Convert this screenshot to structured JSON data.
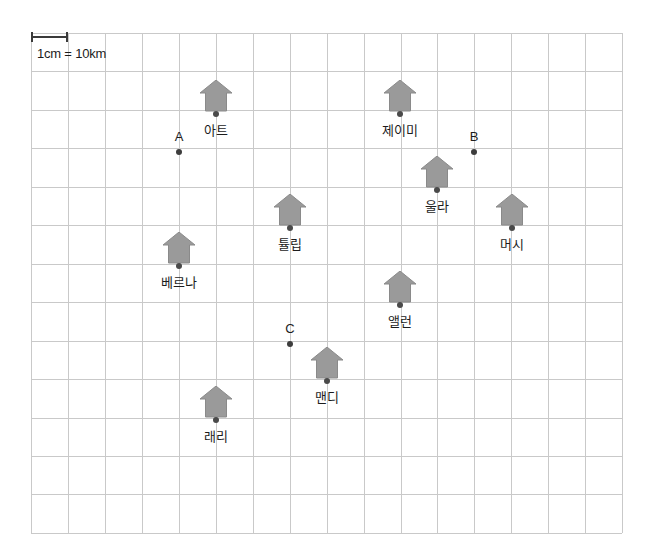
{
  "diagram": {
    "type": "map-with-scale-grid",
    "scale": {
      "label": "1cm = 10km",
      "bar_length_px": 37,
      "bar_x": 31,
      "bar_y": 32,
      "label_x": 37,
      "label_y": 46
    },
    "grid": {
      "x": 31,
      "y": 33,
      "columns": 16,
      "rows": 13,
      "cell_width": 36.95,
      "cell_height": 38.45,
      "line_color": "#c9c9c9"
    },
    "house_color": "#9a9a9a",
    "house_outline": "#8a8a8a",
    "dot_color": "#4a4a4a",
    "places": [
      {
        "name": "아트",
        "icon": "house-icon",
        "x": 216,
        "y": 114,
        "label_dy": 20
      },
      {
        "name": "제이미",
        "icon": "house-icon",
        "x": 400,
        "y": 114,
        "label_dy": 20
      },
      {
        "name": "울라",
        "icon": "house-icon",
        "x": 437,
        "y": 190,
        "label_dy": 20
      },
      {
        "name": "머시",
        "icon": "house-icon",
        "x": 512,
        "y": 228,
        "label_dy": 20
      },
      {
        "name": "튤립",
        "icon": "house-icon",
        "x": 290,
        "y": 228,
        "label_dy": 20
      },
      {
        "name": "베르나",
        "icon": "house-icon",
        "x": 179,
        "y": 266,
        "label_dy": 20
      },
      {
        "name": "앨런",
        "icon": "house-icon",
        "x": 400,
        "y": 305,
        "label_dy": 20
      },
      {
        "name": "맨디",
        "icon": "house-icon",
        "x": 327,
        "y": 381,
        "label_dy": 20
      },
      {
        "name": "래리",
        "icon": "house-icon",
        "x": 216,
        "y": 420,
        "label_dy": 20
      }
    ],
    "points": [
      {
        "name": "A",
        "x": 179,
        "y": 152,
        "label_dy": -8
      },
      {
        "name": "B",
        "x": 474,
        "y": 152,
        "label_dy": -8
      },
      {
        "name": "C",
        "x": 290,
        "y": 344,
        "label_dy": -8
      }
    ]
  }
}
